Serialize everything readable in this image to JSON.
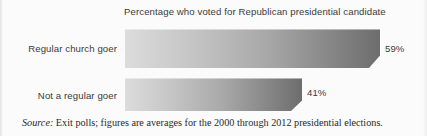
{
  "chart_data": {
    "type": "bar",
    "orientation": "horizontal",
    "title": "Percentage who voted for Republican presidential candidate",
    "xlabel": "",
    "ylabel": "",
    "xlim": [
      0,
      70
    ],
    "grid": false,
    "legend": "none",
    "categories": [
      "Regular church goer",
      "Not a regular goer"
    ],
    "values": [
      59,
      41
    ],
    "value_labels": [
      "59%",
      "41%"
    ],
    "bar_color_start": "#dcdcdc",
    "bar_color_end": "#6d6d6d",
    "text_color": "#3a3a3a"
  },
  "title": {
    "text": "Percentage who voted for Republican presidential candidate"
  },
  "bars": [
    {
      "label": "Regular church goer",
      "value": 59,
      "value_label": "59%"
    },
    {
      "label": "Not a regular goer",
      "value": 41,
      "value_label": "41%"
    }
  ],
  "source": {
    "prefix": "Source:",
    "text": " Exit polls; figures are averages for the 2000 through 2012 presidential elections."
  }
}
